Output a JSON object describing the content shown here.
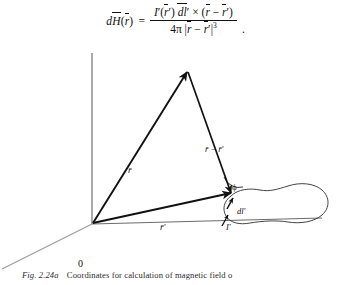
{
  "equation": {
    "lhs": "dH(r)",
    "numerator": "I'(r') dl'  ×  (r − r')",
    "denominator": "4π |r − r'|3",
    "equals": "=",
    "trailing_punctuation": ".",
    "parts": {
      "d": "d",
      "H": "H",
      "r_paren_open": "(",
      "r": "r",
      "r_paren_close": ")",
      "I": "I",
      "prime": "'",
      "dl": "dl",
      "times": "×",
      "minus": "−",
      "four_pi": "4π",
      "abs_bar": "|",
      "exponent": "3"
    }
  },
  "figure": {
    "origin_label": "0",
    "vector_r_label": "r̄",
    "vector_r_prime_label": "r̄′",
    "vector_difference_label": "r̄ − r̄′",
    "angle_label": "ϕ",
    "dl_label": "dl′",
    "current_label": "I′",
    "axes": {
      "z_axis": "vertical-axis",
      "y_axis": "horizontal-axis",
      "x_axis": "diagonal-axis"
    },
    "colors": {
      "vector": "#111111",
      "axis": "#6b6b6b",
      "loop": "#3a3a3a",
      "text": "#111111"
    }
  },
  "caption": {
    "figure_number": "Fig. 2.24a",
    "text": "Coordinates for calculation of magnetic field o"
  }
}
